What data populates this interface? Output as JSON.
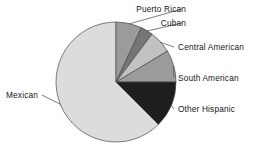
{
  "chart_data": {
    "type": "pie",
    "title": "",
    "subtitle": "",
    "xlabel": "",
    "ylabel": "",
    "legend_position": "none",
    "labels_position": "outside-with-leader-lines",
    "grid": false,
    "categories": [
      "Mexican",
      "Puerto Rican",
      "Cuban",
      "Central American",
      "South American",
      "Other Hispanic"
    ],
    "values": [
      62.5,
      7.0,
      3.3,
      6.1,
      8.6,
      12.5
    ],
    "unit": "percent",
    "slices": [
      {
        "label": "Mexican",
        "value": 62.5,
        "start_angle": 135,
        "end_angle": 360,
        "color": "#dcdcda",
        "label_side": "left",
        "label_x": 38,
        "label_y": 98
      },
      {
        "label": "Puerto Rican",
        "value": 7.0,
        "start_angle": 0,
        "end_angle": 25,
        "color": "#9b9b99",
        "label_side": "right",
        "label_x": 186,
        "label_y": 12
      },
      {
        "label": "Cuban",
        "value": 3.3,
        "start_angle": 25,
        "end_angle": 37,
        "color": "#757574",
        "label_side": "right",
        "label_x": 186,
        "label_y": 26
      },
      {
        "label": "Central American",
        "value": 6.1,
        "start_angle": 37,
        "end_angle": 59,
        "color": "#c2c2c0",
        "label_side": "right",
        "label_x": 178,
        "label_y": 50
      },
      {
        "label": "South American",
        "value": 8.6,
        "start_angle": 59,
        "end_angle": 90,
        "color": "#9b9b99",
        "label_side": "right",
        "label_x": 178,
        "label_y": 81
      },
      {
        "label": "Other Hispanic",
        "value": 12.5,
        "start_angle": 90,
        "end_angle": 135,
        "color": "#1e1e1e",
        "label_side": "right",
        "label_x": 178,
        "label_y": 112
      }
    ],
    "geometry": {
      "center_x": 116,
      "center_y": 82,
      "radius": 60
    },
    "colors": {
      "mexican": "#dcdcda",
      "puerto_rican": "#9b9b99",
      "cuban": "#757574",
      "central_american": "#c2c2c0",
      "south_american": "#9b9b99",
      "other_hispanic": "#1e1e1e",
      "outline": "#4a4a4a",
      "leader_line": "#5a5a5a",
      "label_text": "#171717",
      "background": "#ffffff"
    }
  }
}
